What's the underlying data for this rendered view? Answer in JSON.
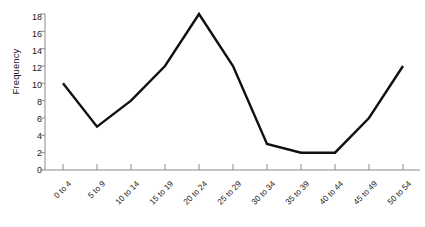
{
  "chart_data": {
    "type": "line",
    "title": "",
    "xlabel": "Number of visits",
    "ylabel": "Frequency",
    "categories": [
      "0 to 4",
      "5 to 9",
      "10 to 14",
      "15 to 19",
      "20 to 24",
      "25 to 29",
      "30 to 34",
      "35 to 39",
      "40 to 44",
      "45 to 49",
      "50 to 54"
    ],
    "values": [
      10,
      5,
      8,
      12,
      18,
      12,
      3,
      2,
      2,
      6,
      12
    ],
    "ylim": [
      0,
      18
    ],
    "yticks": [
      0,
      2,
      4,
      6,
      8,
      10,
      12,
      14,
      16,
      18
    ],
    "ytick_labels": [
      "0",
      "2",
      "4",
      "6",
      "8",
      "10",
      "12",
      "14",
      "16",
      "18"
    ],
    "grid": false,
    "legend": false,
    "line_color": "#101010",
    "axis_color": "#808080",
    "background": "#ffffff"
  }
}
